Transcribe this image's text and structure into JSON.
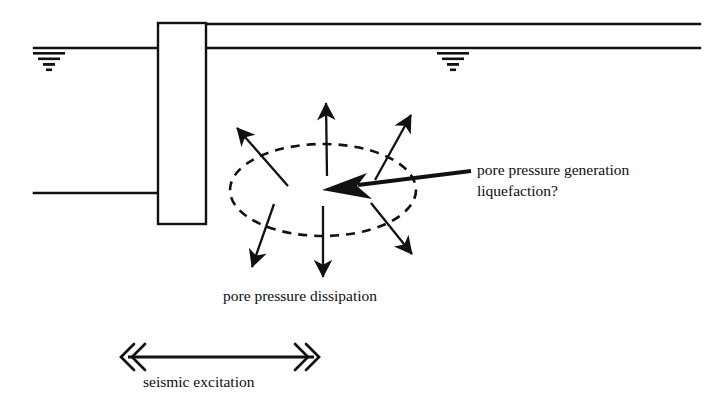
{
  "figure": {
    "type": "geotechnical-seismic-schematic",
    "background_color": "#ffffff",
    "ink_color": "#111111"
  },
  "labels": {
    "generation_line1": "pore pressure generation",
    "generation_line2": "liquefaction?",
    "dissipation": "pore pressure dissipation",
    "seismic": "seismic excitation"
  },
  "elements": {
    "structure": {
      "name": "caisson-structure",
      "shape": "rectangle",
      "x": 158,
      "y": 23,
      "width": 48,
      "height": 201
    },
    "ground_lines": [
      {
        "name": "upper-right-ground-surface",
        "x1": 206,
        "y1": 24,
        "x2": 700,
        "y2": 24
      },
      {
        "name": "right-water-level-line",
        "x1": 206,
        "y1": 48,
        "x2": 700,
        "y2": 48
      },
      {
        "name": "left-water-level-line",
        "x1": 34,
        "y1": 48,
        "x2": 158,
        "y2": 48
      },
      {
        "name": "left-seabed-line",
        "x1": 34,
        "y1": 193,
        "x2": 158,
        "y2": 193
      }
    ],
    "water_table_symbols": [
      {
        "name": "water-table-symbol-left",
        "x": 44,
        "y": 52
      },
      {
        "name": "water-table-symbol-right",
        "x": 448,
        "y": 52
      }
    ],
    "liquefaction_zone": {
      "name": "dashed-ellipse-liquefaction-zone",
      "cx": 323,
      "cy": 190,
      "rx": 93,
      "ry": 46,
      "stroke_dash": "9 7"
    },
    "dissipation_arrows": [
      {
        "name": "arrow-up-left",
        "x1": 288,
        "y1": 186,
        "x2": 235,
        "y2": 126
      },
      {
        "name": "arrow-up",
        "x1": 327,
        "y1": 176,
        "x2": 326,
        "y2": 100
      },
      {
        "name": "arrow-up-right",
        "x1": 375,
        "y1": 180,
        "x2": 413,
        "y2": 112
      },
      {
        "name": "arrow-down-left",
        "x1": 274,
        "y1": 204,
        "x2": 250,
        "y2": 270
      },
      {
        "name": "arrow-down",
        "x1": 323,
        "y1": 206,
        "x2": 323,
        "y2": 280
      },
      {
        "name": "arrow-down-right",
        "x1": 371,
        "y1": 203,
        "x2": 414,
        "y2": 257
      }
    ],
    "pointer_arrow": {
      "name": "pore-pressure-generation-pointer-arrow",
      "x1": 471,
      "y1": 171,
      "x2": 324,
      "y2": 190
    },
    "seismic_arrow": {
      "name": "seismic-excitation-double-arrow",
      "x1": 124,
      "y1": 357,
      "x2": 318,
      "y2": 357,
      "head_style": "double-chevron"
    }
  }
}
